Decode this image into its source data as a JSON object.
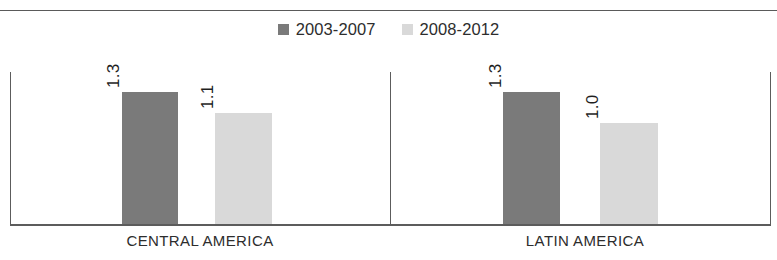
{
  "chart_data": {
    "type": "bar",
    "title": "",
    "subtitle": "",
    "xlabel": "",
    "ylabel": "",
    "grid": false,
    "legend_position": "top-center",
    "categories": [
      "CENTRAL AMERICA",
      "LATIN AMERICA"
    ],
    "ylim": [
      0,
      1.5
    ],
    "series": [
      {
        "name": "2003-2007",
        "color": "#7a7a7a",
        "values": [
          1.3,
          1.3
        ],
        "value_labels": [
          "1.3",
          "1.3"
        ]
      },
      {
        "name": "2008-2012",
        "color": "#d9d9d9",
        "values": [
          1.1,
          1.0
        ],
        "value_labels": [
          "1.1",
          "1.0"
        ]
      }
    ]
  },
  "legend": {
    "entries": [
      {
        "label": "2003-2007",
        "swatch_icon": "legend-swatch-dark"
      },
      {
        "label": "2008-2012",
        "swatch_icon": "legend-swatch-light"
      }
    ]
  },
  "axis": {
    "baseline_color": "#5c5c5c",
    "divider_color": "#5c5c5c"
  },
  "colors": {
    "series_1": "#7a7a7a",
    "series_2": "#d9d9d9",
    "text": "#2d2d2d",
    "rule": "#5a5a5a",
    "background": "#ffffff"
  }
}
